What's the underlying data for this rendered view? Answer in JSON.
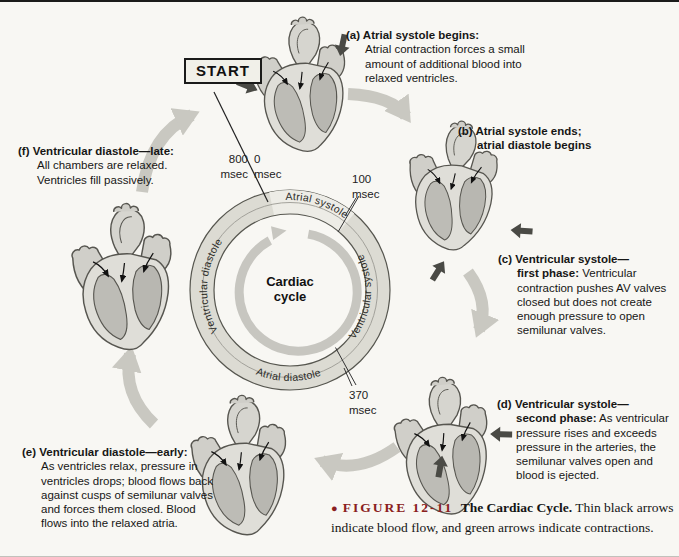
{
  "start": {
    "label": "START"
  },
  "center": {
    "line1": "Cardiac",
    "line2": "cycle"
  },
  "ring": {
    "segments": {
      "top": "Atrial systole",
      "right": "Ventricular systole",
      "bottom": "Atrial diastole",
      "left": "Ventricular diastole"
    }
  },
  "times": {
    "t800": {
      "value": "800",
      "unit": "msec"
    },
    "t0": {
      "value": "0",
      "unit": "msec"
    },
    "t100": {
      "value": "100",
      "unit": "msec"
    },
    "t370": {
      "value": "370",
      "unit": "msec"
    }
  },
  "stages": {
    "a": {
      "head": "(a) Atrial systole begins:",
      "subhead": "",
      "body": "Atrial contraction forces a small amount of additional blood into relaxed ventricles."
    },
    "b": {
      "head": "(b) Atrial systole ends;",
      "subhead": "atrial diastole begins",
      "body": ""
    },
    "c": {
      "head": "(c) Ventricular systole—",
      "subhead": "first phase:",
      "body": "Ventricular contraction pushes AV valves closed but does not create enough pressure to open semilunar valves."
    },
    "d": {
      "head": "(d) Ventricular systole—",
      "subhead": "second phase:",
      "body": "As ventricular pressure rises and exceeds pressure in the arteries, the semilunar valves open and blood is ejected."
    },
    "e": {
      "head": "(e) Ventricular diastole—early:",
      "subhead": "",
      "body": "As ventricles relax, pressure in ventricles drops; blood flows back against cusps of semilunar valves and forces them closed. Blood flows into the relaxed atria."
    },
    "f": {
      "head": "(f) Ventricular diastole—late:",
      "subhead": "",
      "body": "All chambers are relaxed. Ventricles fill passively."
    }
  },
  "caption": {
    "bullet": "●",
    "figure_ref": "FIGURE 12-11",
    "title": "The Cardiac Cycle.",
    "text": "Thin black arrows indicate blood flow, and green arrows indicate contractions."
  },
  "colors": {
    "ring_fill": "#dcdbd3",
    "ring_highlight_wedge": "#edece6",
    "ring_stroke": "#56564f",
    "inner_cycle_arrow": "#c7c6c0",
    "connector_arrow": "#c9c8c1",
    "contraction_arrow": "#4a4a45",
    "figure_ref_color": "#8a2020",
    "heart_body": "#dfded8",
    "heart_cavity": "#bcbbb5",
    "background": "#f8f7f3"
  }
}
